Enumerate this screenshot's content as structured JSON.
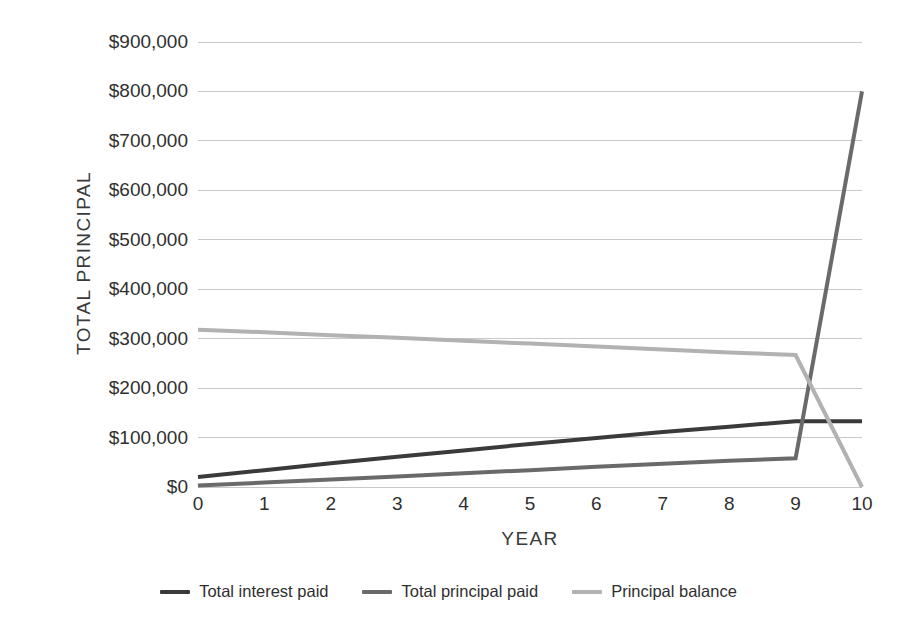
{
  "chart_data": {
    "type": "line",
    "title": "",
    "subtitle": "",
    "xlabel": "YEAR",
    "ylabel": "TOTAL PRINCIPAL",
    "x": [
      0,
      1,
      2,
      3,
      4,
      5,
      6,
      7,
      8,
      9,
      10
    ],
    "xlim": [
      0,
      10
    ],
    "ylim": [
      0,
      900000
    ],
    "ytick_values": [
      0,
      100000,
      200000,
      300000,
      400000,
      500000,
      600000,
      700000,
      800000,
      900000
    ],
    "ytick_labels": [
      "$0",
      "$100,000",
      "$200,000",
      "$300,000",
      "$400,000",
      "$500,000",
      "$600,000",
      "$700,000",
      "$800,000",
      "$900,000"
    ],
    "xtick_labels": [
      "0",
      "1",
      "2",
      "3",
      "4",
      "5",
      "6",
      "7",
      "8",
      "9",
      "10"
    ],
    "grid": true,
    "grid_axis": "y",
    "legend_position": "bottom",
    "series": [
      {
        "name": "Total interest paid",
        "color": "#3a3a3a",
        "width": 4,
        "values": [
          20000,
          34000,
          48000,
          61000,
          74000,
          87000,
          99000,
          111000,
          122000,
          133000,
          133000
        ]
      },
      {
        "name": "Total principal paid",
        "color": "#6a6a6a",
        "width": 4,
        "values": [
          3000,
          9000,
          15000,
          21000,
          28000,
          34000,
          41000,
          47000,
          53000,
          58000,
          800000
        ]
      },
      {
        "name": "Principal balance",
        "color": "#b2b2b2",
        "width": 4,
        "values": [
          318000,
          313000,
          307000,
          302000,
          296000,
          290000,
          284000,
          278000,
          272000,
          267000,
          0
        ]
      }
    ]
  },
  "axes": {
    "y_title": "TOTAL PRINCIPAL",
    "x_title": "YEAR"
  },
  "legend": {
    "items": [
      {
        "label": "Total interest paid",
        "color": "#3a3a3a"
      },
      {
        "label": "Total principal paid",
        "color": "#6a6a6a"
      },
      {
        "label": "Principal balance",
        "color": "#b2b2b2"
      }
    ]
  },
  "style": {
    "background": "#ffffff",
    "gridline_color": "#c9c9c9",
    "text_color": "#2f2f2f"
  }
}
